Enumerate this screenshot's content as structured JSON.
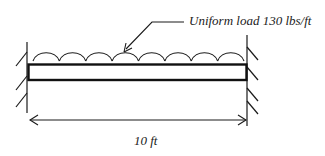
{
  "diagram": {
    "type": "fixed-fixed beam with uniform distributed load",
    "load_label": "Uniform load 130 lbs/ft",
    "span_label": "10 ft",
    "load": {
      "value": 130,
      "unit": "lbs/ft",
      "kind": "uniform"
    },
    "span": {
      "value": 10,
      "unit": "ft"
    },
    "supports": {
      "left": "fixed",
      "right": "fixed"
    },
    "load_arc_count": 8,
    "colors": {
      "stroke": "#1a1a1a",
      "text": "#222222",
      "background": "#ffffff"
    }
  }
}
